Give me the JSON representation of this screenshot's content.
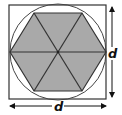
{
  "diagram": {
    "labels": {
      "vertical_dimension": "d",
      "horizontal_dimension": "d"
    },
    "colors": {
      "hexagon_fill": "#a9a9a9",
      "stroke": "#333333",
      "background": "#ffffff"
    },
    "geometry": {
      "square": {
        "x": 9,
        "y": 5,
        "size": 97
      },
      "circle": {
        "cx": 58,
        "cy": 52,
        "r": 48
      },
      "hexagon_points": "10,52 34,13 82,13 106,52 82,91 34,91"
    }
  }
}
